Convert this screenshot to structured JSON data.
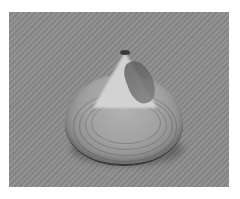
{
  "image": {
    "subject": "clam shell",
    "description": "Grayscale photograph of a single bivalve clam shell resting on a textured gray surface",
    "colors": {
      "background": "#ffffff",
      "surface": "#8c8c8c",
      "shell_light": "#d2d2d2",
      "shell_mid": "#a2a2a2",
      "shell_edge": "#3a3a3a"
    }
  }
}
